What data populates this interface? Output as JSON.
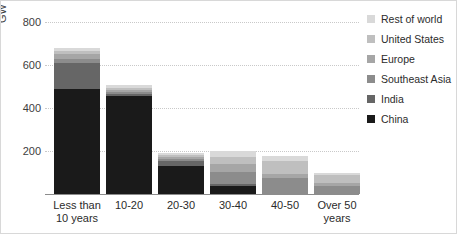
{
  "chart_data": {
    "type": "bar",
    "stacked": true,
    "title": "",
    "subtitle": "",
    "xlabel": "",
    "ylabel": "GW",
    "ylim": [
      0,
      800
    ],
    "yticks": [
      200,
      400,
      600,
      800
    ],
    "ytick_labels": [
      "200",
      "400",
      "600",
      "800"
    ],
    "grid": true,
    "legend_position": "right",
    "categories": [
      "Less than 10 years",
      "10-20",
      "20-30",
      "30-40",
      "40-50",
      "Over 50 years"
    ],
    "category_labels": [
      [
        "Less than",
        "10 years"
      ],
      [
        "10-20"
      ],
      [
        "20-30"
      ],
      [
        "30-40"
      ],
      [
        "40-50"
      ],
      [
        "Over 50",
        "years"
      ]
    ],
    "series": [
      {
        "name": "China",
        "color": "#1a1a1a",
        "values": [
          490,
          455,
          130,
          35,
          0,
          0
        ]
      },
      {
        "name": "India",
        "color": "#666666",
        "values": [
          120,
          8,
          25,
          12,
          0,
          0
        ]
      },
      {
        "name": "Southeast Asia",
        "color": "#8c8c8c",
        "values": [
          20,
          10,
          10,
          55,
          75,
          35
        ]
      },
      {
        "name": "Europe",
        "color": "#a6a6a6",
        "values": [
          20,
          12,
          8,
          40,
          20,
          15
        ]
      },
      {
        "name": "United States",
        "color": "#bfbfbf",
        "values": [
          15,
          10,
          8,
          30,
          60,
          40
        ]
      },
      {
        "name": "Rest of world",
        "color": "#d9d9d9",
        "values": [
          15,
          10,
          9,
          28,
          20,
          10
        ]
      }
    ],
    "totals": [
      680,
      505,
      190,
      200,
      175,
      100
    ]
  },
  "legend": {
    "items": [
      {
        "label": "Rest of world",
        "color": "#d9d9d9"
      },
      {
        "label": "United States",
        "color": "#bfbfbf"
      },
      {
        "label": "Europe",
        "color": "#a6a6a6"
      },
      {
        "label": "Southeast Asia",
        "color": "#8c8c8c"
      },
      {
        "label": "India",
        "color": "#666666"
      },
      {
        "label": "China",
        "color": "#1a1a1a"
      }
    ]
  },
  "axis": {
    "y_title": "GW"
  },
  "colors": {
    "gridline": "#c9c9c9",
    "baseline": "#8c8c8c",
    "text": "#2b2b2b",
    "frame": "#d8d8d8",
    "background": "#ffffff"
  }
}
